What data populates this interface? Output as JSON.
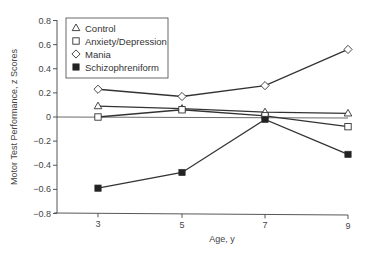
{
  "chart_data": {
    "type": "line",
    "title": "",
    "xlabel": "Age, y",
    "ylabel": "Motor Test Performance, z Scores",
    "x": [
      3,
      5,
      7,
      9
    ],
    "xticks": [
      "3",
      "5",
      "7",
      "9"
    ],
    "yticks": [
      "0.8",
      "0.6",
      "0.4",
      "0.2",
      "0",
      "−0.2",
      "−0.4",
      "−0.6",
      "−0.8"
    ],
    "ylim": [
      -0.8,
      0.8
    ],
    "grid": false,
    "zero_line": true,
    "legend_position": "upper-left",
    "series": [
      {
        "name": "Control",
        "marker": "open-triangle",
        "values": [
          0.09,
          0.07,
          0.04,
          0.03
        ]
      },
      {
        "name": "Anxiety/Depression",
        "marker": "open-square",
        "values": [
          0.0,
          0.06,
          0.01,
          -0.08
        ]
      },
      {
        "name": "Mania",
        "marker": "open-diamond",
        "values": [
          0.23,
          0.17,
          0.26,
          0.56
        ]
      },
      {
        "name": "Schizophreniform",
        "marker": "filled-square",
        "values": [
          -0.59,
          -0.46,
          -0.02,
          -0.31
        ]
      }
    ]
  },
  "colors": {
    "line": "#333333",
    "axis": "#444444",
    "marker_fill_open": "#ffffff",
    "marker_fill_filled": "#222222"
  }
}
